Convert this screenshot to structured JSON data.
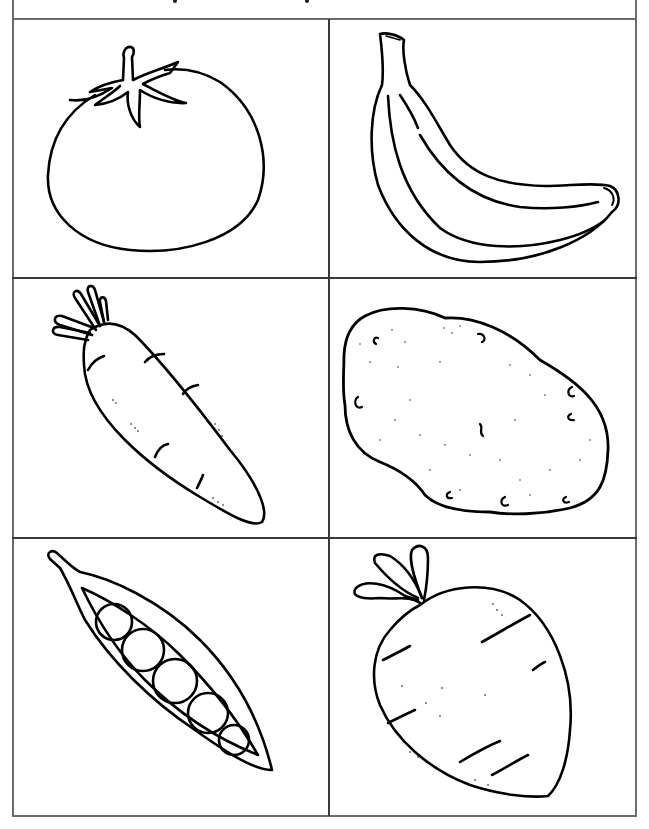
{
  "worksheet": {
    "header_fragment": "",
    "grid": {
      "rows": 3,
      "columns": 2
    },
    "cells": [
      {
        "label": "tomato",
        "icon": "tomato-icon"
      },
      {
        "label": "banana",
        "icon": "banana-icon"
      },
      {
        "label": "carrot",
        "icon": "carrot-icon"
      },
      {
        "label": "potato",
        "icon": "potato-icon"
      },
      {
        "label": "pea pod",
        "icon": "pea-pod-icon"
      },
      {
        "label": "beet",
        "icon": "beet-icon"
      }
    ],
    "colors": {
      "line": "#000000",
      "border": "#6b6b6b",
      "background": "#ffffff"
    }
  }
}
